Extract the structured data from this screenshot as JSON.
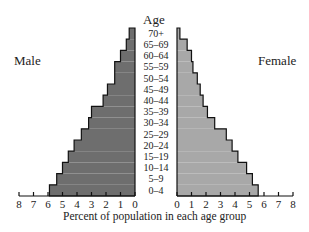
{
  "chart_data": {
    "type": "bar",
    "subtype": "population-pyramid",
    "title": "",
    "xlabel": "Percent of population in each age group",
    "ylabel": "Age",
    "categories": [
      "0–4",
      "5–9",
      "10–14",
      "15–19",
      "20–24",
      "25–29",
      "30–34",
      "35–39",
      "40–44",
      "45–49",
      "50–54",
      "55–59",
      "60–64",
      "65–69",
      "70+"
    ],
    "series": [
      {
        "name": "Male",
        "color": "#6e6e6e",
        "values": [
          5.9,
          5.4,
          5.0,
          4.6,
          4.2,
          3.7,
          3.2,
          3.0,
          2.2,
          1.9,
          1.4,
          1.4,
          1.0,
          0.6,
          0.4
        ]
      },
      {
        "name": "Female",
        "color": "#a8a8a8",
        "values": [
          5.6,
          5.2,
          4.8,
          4.2,
          3.8,
          3.4,
          2.6,
          2.1,
          1.8,
          1.6,
          1.4,
          1.1,
          1.0,
          0.7,
          0.2
        ]
      }
    ],
    "xlim": [
      0,
      8
    ],
    "xticks": [
      0,
      1,
      2,
      3,
      4,
      5,
      6,
      7,
      8
    ],
    "grid": false,
    "legend": "side labels (Male left, Female right)"
  },
  "labels": {
    "male": "Male",
    "female": "Female",
    "age": "Age",
    "xlabel": "Percent of population in each age group"
  }
}
